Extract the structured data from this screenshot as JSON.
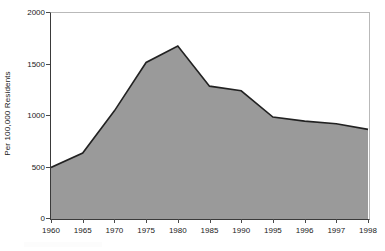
{
  "chart_data": {
    "type": "area",
    "title": "",
    "subtitle": "",
    "xlabel": "",
    "ylabel": "Per 100,000 Residents",
    "categories": [
      "1960",
      "1965",
      "1970",
      "1975",
      "1980",
      "1985",
      "1990",
      "1995",
      "1996",
      "1997",
      "1998"
    ],
    "values": [
      500,
      640,
      1050,
      1520,
      1680,
      1290,
      1245,
      990,
      950,
      925,
      870
    ],
    "series": [
      {
        "name": "Per 100,000 Residents",
        "values": [
          500,
          640,
          1050,
          1520,
          1680,
          1290,
          1245,
          990,
          950,
          925,
          870
        ]
      }
    ],
    "ylim": [
      0,
      2000
    ],
    "y_ticks": [
      0,
      500,
      1000,
      1500,
      2000
    ],
    "y_tick_labels": [
      "0",
      "500",
      "1000",
      "1500",
      "2000"
    ],
    "x_tick_labels": [
      "1960",
      "1965",
      "1970",
      "1975",
      "1980",
      "1985",
      "1990",
      "1995",
      "1996",
      "1997",
      "1998"
    ],
    "grid": false,
    "legend": false,
    "legend_position": "none",
    "colors": {
      "area_fill": "#9a9a9a",
      "line": "#222222",
      "axis": "#3a3a3a",
      "frame": "#b9b9b9",
      "text": "#1a1a1a",
      "background": "#ffffff"
    }
  }
}
